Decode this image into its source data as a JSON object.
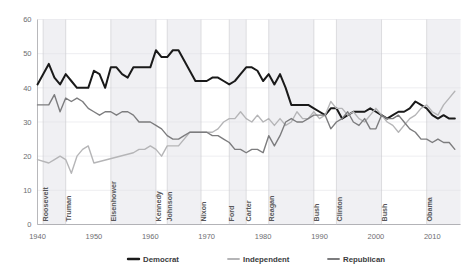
{
  "chart_data": {
    "type": "line",
    "title": "",
    "xlabel": "",
    "ylabel": "",
    "xlim": [
      1940,
      2015
    ],
    "ylim": [
      0,
      60
    ],
    "grid": true,
    "legend_position": "bottom",
    "y_ticks": [
      "0",
      "10",
      "20",
      "30",
      "40",
      "50",
      "60"
    ],
    "y_tick_values": [
      0,
      10,
      20,
      30,
      40,
      50,
      60
    ],
    "x_ticks": [
      "1940",
      "1950",
      "1960",
      "1970",
      "1980",
      "1990",
      "2000",
      "2010"
    ],
    "x_tick_values": [
      1940,
      1950,
      1960,
      1970,
      1980,
      1990,
      2000,
      2010
    ],
    "colors": {
      "Democrat": "#1a1a1a",
      "Independent": "#b5b5b7",
      "Republican": "#7c7c7e"
    },
    "series": [
      {
        "name": "Democrat",
        "color": "#1a1a1a",
        "x": [
          1940,
          1942,
          1943,
          1944,
          1945,
          1946,
          1947,
          1948,
          1949,
          1950,
          1951,
          1952,
          1953,
          1954,
          1955,
          1956,
          1957,
          1958,
          1959,
          1960,
          1961,
          1962,
          1963,
          1964,
          1965,
          1966,
          1967,
          1968,
          1969,
          1970,
          1971,
          1972,
          1973,
          1974,
          1975,
          1976,
          1977,
          1978,
          1979,
          1980,
          1981,
          1982,
          1983,
          1984,
          1985,
          1986,
          1987,
          1988,
          1989,
          1990,
          1991,
          1992,
          1993,
          1994,
          1995,
          1996,
          1997,
          1998,
          1999,
          2000,
          2001,
          2002,
          2003,
          2004,
          2005,
          2006,
          2007,
          2008,
          2009,
          2010,
          2011,
          2012,
          2013,
          2014
        ],
        "values": [
          41,
          47,
          43,
          41,
          44,
          42,
          40,
          40,
          40,
          45,
          44,
          40,
          46,
          46,
          44,
          43,
          46,
          46,
          46,
          46,
          51,
          49,
          49,
          51,
          51,
          48,
          45,
          42,
          42,
          42,
          43,
          43,
          42,
          41,
          42,
          44,
          46,
          46,
          45,
          42,
          44,
          41,
          44,
          40,
          35,
          35,
          35,
          35,
          34,
          33,
          32,
          34,
          34,
          31,
          32,
          33,
          33,
          33,
          34,
          33,
          32,
          31,
          32,
          33,
          33,
          34,
          36,
          35,
          34,
          32,
          31,
          32,
          31,
          31
        ]
      },
      {
        "name": "Independent",
        "color": "#b5b5b7",
        "x": [
          1940,
          1942,
          1943,
          1944,
          1945,
          1946,
          1947,
          1948,
          1949,
          1950,
          1957,
          1958,
          1959,
          1960,
          1961,
          1962,
          1963,
          1964,
          1965,
          1966,
          1967,
          1968,
          1969,
          1970,
          1971,
          1972,
          1973,
          1974,
          1975,
          1976,
          1977,
          1978,
          1979,
          1980,
          1981,
          1982,
          1983,
          1984,
          1985,
          1986,
          1987,
          1988,
          1989,
          1990,
          1991,
          1992,
          1993,
          1994,
          1995,
          1996,
          1997,
          1998,
          1999,
          2000,
          2001,
          2002,
          2003,
          2004,
          2005,
          2006,
          2007,
          2008,
          2009,
          2010,
          2011,
          2012,
          2013,
          2014
        ],
        "values": [
          19,
          18,
          19,
          20,
          19,
          15,
          20,
          22,
          23,
          18,
          21,
          22,
          22,
          23,
          22,
          20,
          23,
          23,
          23,
          25,
          27,
          27,
          27,
          27,
          27,
          28,
          30,
          31,
          31,
          33,
          31,
          30,
          32,
          30,
          31,
          29,
          31,
          29,
          30,
          33,
          31,
          31,
          33,
          31,
          32,
          36,
          34,
          34,
          32,
          33,
          31,
          30,
          32,
          34,
          32,
          30,
          29,
          27,
          29,
          31,
          32,
          34,
          35,
          33,
          32,
          35,
          37,
          39
        ]
      },
      {
        "name": "Republican",
        "color": "#7c7c7e",
        "x": [
          1940,
          1942,
          1943,
          1944,
          1945,
          1946,
          1947,
          1948,
          1949,
          1950,
          1951,
          1952,
          1953,
          1954,
          1955,
          1956,
          1957,
          1958,
          1959,
          1960,
          1961,
          1962,
          1963,
          1964,
          1965,
          1966,
          1967,
          1968,
          1969,
          1970,
          1971,
          1972,
          1973,
          1974,
          1975,
          1976,
          1977,
          1978,
          1979,
          1980,
          1981,
          1982,
          1983,
          1984,
          1985,
          1986,
          1987,
          1988,
          1989,
          1990,
          1991,
          1992,
          1993,
          1994,
          1995,
          1996,
          1997,
          1998,
          1999,
          2000,
          2001,
          2002,
          2003,
          2004,
          2005,
          2006,
          2007,
          2008,
          2009,
          2010,
          2011,
          2012,
          2013,
          2014
        ],
        "values": [
          35,
          35,
          38,
          33,
          37,
          36,
          37,
          36,
          34,
          33,
          32,
          33,
          33,
          32,
          33,
          33,
          32,
          30,
          30,
          30,
          29,
          28,
          26,
          25,
          25,
          26,
          27,
          27,
          27,
          27,
          26,
          26,
          25,
          24,
          22,
          22,
          21,
          22,
          22,
          21,
          26,
          23,
          26,
          30,
          31,
          30,
          30,
          31,
          32,
          32,
          32,
          28,
          30,
          31,
          33,
          30,
          29,
          31,
          28,
          28,
          32,
          31,
          31,
          32,
          30,
          28,
          27,
          25,
          25,
          24,
          25,
          24,
          24,
          22
        ]
      }
    ],
    "presidents": [
      {
        "name": "Roosevelt",
        "start": 1941,
        "end": 1945
      },
      {
        "name": "Truman",
        "start": 1945,
        "end": 1953
      },
      {
        "name": "Eisenhower",
        "start": 1953,
        "end": 1961
      },
      {
        "name": "Kennedy",
        "start": 1961,
        "end": 1963
      },
      {
        "name": "Johnson",
        "start": 1963,
        "end": 1969
      },
      {
        "name": "Nixon",
        "start": 1969,
        "end": 1974
      },
      {
        "name": "Ford",
        "start": 1974,
        "end": 1977
      },
      {
        "name": "Carter",
        "start": 1977,
        "end": 1981
      },
      {
        "name": "Reagan",
        "start": 1981,
        "end": 1989
      },
      {
        "name": "Bush",
        "start": 1989,
        "end": 1993
      },
      {
        "name": "Clinton",
        "start": 1993,
        "end": 2001
      },
      {
        "name": "Bush",
        "start": 2001,
        "end": 2009
      },
      {
        "name": "Obama",
        "start": 2009,
        "end": 2015
      }
    ],
    "shaded_terms": [
      "Roosevelt",
      "Eisenhower",
      "Johnson",
      "Ford",
      "Reagan",
      "Clinton",
      "Obama"
    ]
  },
  "legend": {
    "items": [
      {
        "label": "Democrat",
        "color": "#1a1a1a"
      },
      {
        "label": "Independent",
        "color": "#b5b5b7"
      },
      {
        "label": "Republican",
        "color": "#7c7c7e"
      }
    ]
  }
}
